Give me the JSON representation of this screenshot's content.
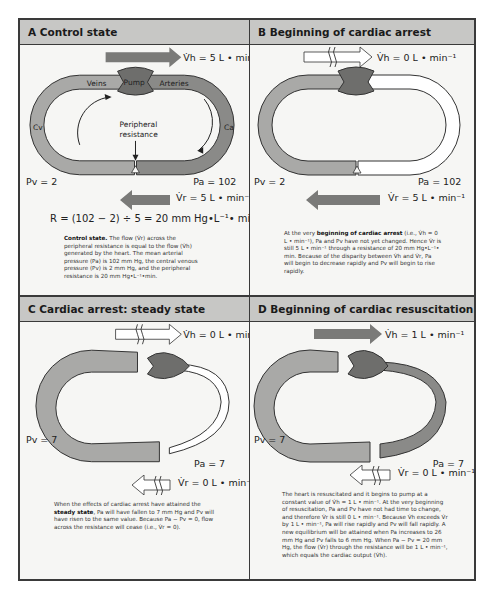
{
  "panels": {
    "a": {
      "title": "A Control state",
      "vh_label": "V̇h = 5 L • min⁻¹",
      "vr_label": "V̇r = 5 L • min⁻¹",
      "pv_label": "Pv = 2",
      "pa_label": "Pa = 102",
      "veins_label": "Veins",
      "pump_label": "Pump",
      "arteries_label": "Arteries",
      "cv_label": "Cv",
      "ca_label": "Ca",
      "resistance_label_1": "Peripheral",
      "resistance_label_2": "resistance",
      "formula": "R = (102 − 2) ÷ 5 = 20 mm Hg•L⁻¹• min",
      "caption_bold": "Control state.",
      "caption_text": " The flow (V̇r) across the peripheral resistance is equal to the flow (V̇h) generated by the heart. The mean arterial pressure (Pa) is 102 mm Hg, the central venous pressure (Pv) is 2 mm Hg, and the peripheral resistance is 20 mm Hg•L⁻¹•min."
    },
    "b": {
      "title": "B Beginning of cardiac arrest",
      "vh_label": "V̇h = 0 L • min⁻¹",
      "vr_label": "V̇r = 5 L • min⁻¹",
      "pv_label": "Pv = 2",
      "pa_label": "Pa = 102",
      "caption_pre": "At the very ",
      "caption_bold": "beginning of cardiac arrest",
      "caption_text": " (i.e., V̇h = 0 L • min⁻¹), Pa and Pv have not yet changed. Hence V̇r is still 5 L • min⁻¹ through a resistance of 20 mm Hg•L⁻¹• min. Because of the disparity between V̇h and V̇r, Pa will begin to decrease rapidly and Pv will begin to rise rapidly."
    },
    "c": {
      "title": "C Cardiac arrest: steady state",
      "vh_label": "V̇h = 0 L • min⁻¹",
      "vr_label": "V̇r = 0 L • min⁻¹",
      "pv_label": "Pv = 7",
      "pa_label": "Pa = 7",
      "caption_pre": "When the effects of cardiac arrest have attained the ",
      "caption_bold": "steady state",
      "caption_text": ", Pa will have fallen to 7 mm Hg and Pv will have risen to the same value. Because Pa − Pv = 0, flow across the resistance will cease (i.e., V̇r = 0)."
    },
    "d": {
      "title": "D Beginning of cardiac resuscitation",
      "vh_label": "V̇h = 1 L • min⁻¹",
      "vr_label": "V̇r = 0 L • min⁻¹",
      "pv_label": "Pv = 7",
      "pa_label": "Pa = 7",
      "caption_text": "The heart is resuscitated and it begins to pump at a constant value of V̇h = 1 L • min⁻¹. At the very beginning of resuscitation, Pa and Pv have not had time to change, and therefore V̇r is still 0 L • min⁻¹. Because V̇h exceeds V̇r by 1 L • min⁻¹, Pa will rise rapidly and Pv will fall rapidly. A new equilibrium will be attained when Pa increases to 26 mm Hg and Pv falls to 6 mm Hg. When Pa − Pv = 20 mm Hg, the flow (V̇r) through the resistance will be 1 L • min⁻¹, which equals the cardiac output (V̇h)."
    }
  },
  "colors": {
    "venous": "#a9a9a7",
    "arterial": "#8a8a88",
    "pump": "#6e6e6c",
    "arrow_filled": "#7a7a78",
    "arrow_empty": "#ffffff",
    "header": "#c7c7c5",
    "panel_bg": "#f6f6f4",
    "outline": "#3a3a3a"
  }
}
